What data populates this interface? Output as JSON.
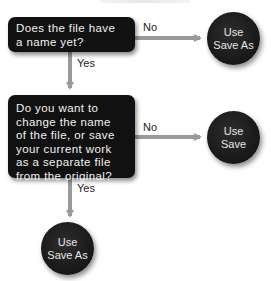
{
  "diagram": {
    "type": "flowchart",
    "colors": {
      "node_fill": "#111111",
      "node_text": "#f2f2f2",
      "arrow": "#9a9a9a",
      "label_text": "#222222",
      "background": "#ffffff"
    },
    "decisions": [
      {
        "id": "q1",
        "lines": [
          "Does the file have",
          "a name yet?"
        ]
      },
      {
        "id": "q2",
        "lines": [
          "Do you want to",
          "change the name",
          "of the file, or save",
          "your current work",
          "as a separate file",
          "from the original?"
        ]
      }
    ],
    "outcomes": [
      {
        "id": "o1",
        "lines": [
          "Use",
          "Save As"
        ]
      },
      {
        "id": "o2",
        "lines": [
          "Use",
          "Save"
        ]
      },
      {
        "id": "o3",
        "lines": [
          "Use",
          "Save As"
        ]
      }
    ],
    "edges": [
      {
        "from": "q1",
        "to": "o1",
        "label": "No"
      },
      {
        "from": "q1",
        "to": "q2",
        "label": "Yes"
      },
      {
        "from": "q2",
        "to": "o2",
        "label": "No"
      },
      {
        "from": "q2",
        "to": "o3",
        "label": "Yes"
      }
    ]
  }
}
